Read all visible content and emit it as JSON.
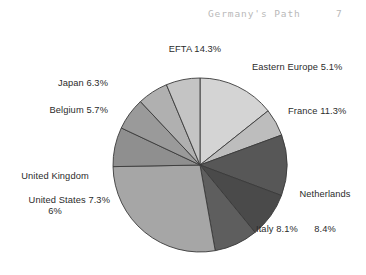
{
  "header": {
    "title": "Germany's Path",
    "page_number": "7"
  },
  "chart_data": {
    "type": "pie",
    "title": "",
    "subtitle": "",
    "xlabel": "",
    "ylabel": "",
    "legend_position": "outside-callout-labels",
    "grid": false,
    "units": "percent",
    "note": "Grayscale pie chart of trading-partner shares. Bottom slice label is cropped off the bottom edge of the page image.",
    "categories": [
      "EFTA",
      "Eastern Europe",
      "France",
      "Netherlands",
      "Italy",
      "Other",
      "United States",
      "United Kingdom",
      "Belgium",
      "Japan"
    ],
    "values": [
      14.3,
      5.1,
      11.3,
      8.4,
      8.1,
      27.5,
      7.3,
      6.0,
      5.7,
      6.3
    ],
    "slices": [
      {
        "name": "EFTA",
        "label": "EFTA 14.3%",
        "value": 14.3,
        "color": "#d4d4d4",
        "label_position": "top"
      },
      {
        "name": "Eastern Europe",
        "label": "Eastern Europe 5.1%",
        "value": 5.1,
        "color": "#bdbdbd",
        "label_position": "top-right"
      },
      {
        "name": "France",
        "label": "France 11.3%",
        "value": 11.3,
        "color": "#575757",
        "label_position": "right"
      },
      {
        "name": "Netherlands",
        "label_line1": "Netherlands",
        "label_line2": "8.4%",
        "value": 8.4,
        "color": "#4a4a4a",
        "label_position": "right"
      },
      {
        "name": "Italy",
        "label": "Italy 8.1%",
        "value": 8.1,
        "color": "#5e5e5e",
        "label_position": "bottom-right"
      },
      {
        "name": "Other",
        "label": "",
        "value": 27.5,
        "color": "#a6a6a6",
        "label_position": "bottom"
      },
      {
        "name": "United States",
        "label": "United States 7.3%",
        "value": 7.3,
        "color": "#8f8f8f",
        "label_position": "left"
      },
      {
        "name": "United Kingdom",
        "label_line1": "United Kingdom",
        "label_line2": "6%",
        "value": 6.0,
        "color": "#9a9a9a",
        "label_position": "left"
      },
      {
        "name": "Belgium",
        "label": "Belgium 5.7%",
        "value": 5.7,
        "color": "#b0b0b0",
        "label_position": "top-left"
      },
      {
        "name": "Japan",
        "label": "Japan 6.3%",
        "value": 6.3,
        "color": "#c4c4c4",
        "label_position": "top-left"
      }
    ],
    "geometry": {
      "center_x": 200,
      "center_y": 165,
      "radius": 87,
      "start_angle_deg": -90,
      "direction": "clockwise"
    },
    "style": {
      "slice_border_color": "#3a3a3a",
      "slice_border_width": 0.9,
      "background": "#ffffff"
    }
  }
}
